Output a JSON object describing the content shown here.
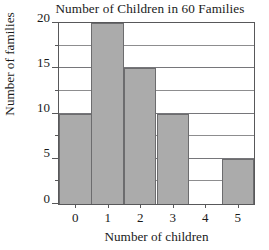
{
  "chart_data": {
    "type": "bar",
    "title": "Number of Children in 60 Families",
    "xlabel": "Number of children",
    "ylabel": "Number of families",
    "categories": [
      "0",
      "1",
      "2",
      "3",
      "4",
      "5"
    ],
    "values": [
      10,
      20,
      15,
      10,
      0,
      5
    ],
    "ylim": [
      0,
      20
    ],
    "ytick_labels": [
      "0",
      "5",
      "10",
      "15",
      "20"
    ],
    "ytick_values": [
      0,
      5,
      10,
      15,
      20
    ],
    "gridline_values": [
      2.5,
      5,
      7.5,
      10,
      12.5,
      15,
      17.5
    ],
    "grid": true,
    "legend": "none",
    "bar_fill_color": "#ababab",
    "bar_edge_color": "#6c6c6e",
    "axis_color": "#58585a",
    "grid_color": "#8d8d8f",
    "background_color": "#ffffff",
    "total": 60
  }
}
